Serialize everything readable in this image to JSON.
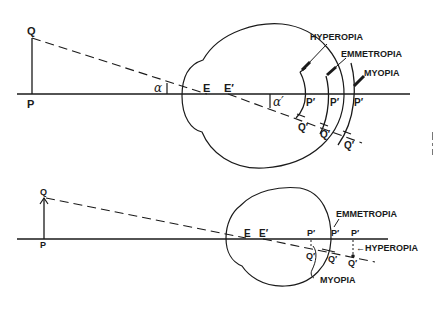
{
  "figure": {
    "top": {
      "object_top": "Q",
      "object_base": "P",
      "angle_object": "α",
      "angle_image": "α′",
      "nodal_point_1": "E",
      "nodal_point_2": "E′",
      "image_base_labels": [
        "P′",
        "P′",
        "P′"
      ],
      "image_top_labels": [
        "Q′",
        "Q′",
        "Q′"
      ],
      "conditions": {
        "hyperopia": "HYPEROPIA",
        "emmetropia": "EMMETROPIA",
        "myopia": "MYOPIA"
      }
    },
    "bottom": {
      "object_top": "Q",
      "object_base": "P",
      "nodal_point_1": "E",
      "nodal_point_2": "E′",
      "image_base_labels": [
        "P′",
        "P′",
        "P′"
      ],
      "image_top_labels": [
        "Q′",
        "Q′",
        "Q′"
      ],
      "conditions": {
        "emmetropia": "EMMETROPIA",
        "hyperopia": "←HYPEROPIA",
        "myopia": "MYOPIA"
      }
    }
  },
  "colors": {
    "ink": "#1a1a1a",
    "background": "#ffffff"
  }
}
